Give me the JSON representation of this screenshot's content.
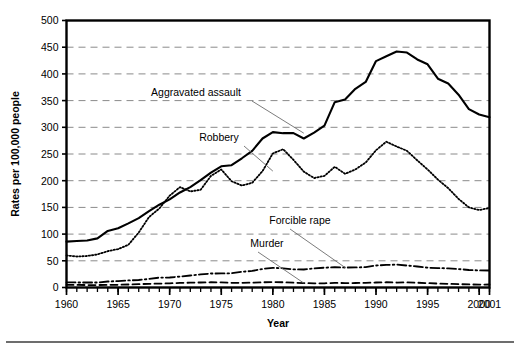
{
  "chart_data": {
    "type": "line",
    "title": "",
    "xlabel": "Year",
    "ylabel": "Rates per 100,000 people",
    "xlim": [
      1960,
      2001
    ],
    "ylim": [
      0,
      500
    ],
    "ytick_step": 50,
    "yticks": [
      0,
      50,
      100,
      150,
      200,
      250,
      300,
      350,
      400,
      450,
      500
    ],
    "xticks": [
      1960,
      1965,
      1970,
      1975,
      1980,
      1985,
      1990,
      1995,
      2000,
      2001
    ],
    "xtick_labels": [
      "1960",
      "1965",
      "1970",
      "1975",
      "1980",
      "1985",
      "1990",
      "1995",
      "2000",
      "2001"
    ],
    "ytick_labels": [
      "0",
      "50",
      "100",
      "150",
      "200",
      "250",
      "300",
      "350",
      "400",
      "450",
      "500"
    ],
    "minor_xticks_every": 1,
    "grid": "horizontal-dashed",
    "legend": "none-inline-annotations",
    "x": [
      1960,
      1961,
      1962,
      1963,
      1964,
      1965,
      1966,
      1967,
      1968,
      1969,
      1970,
      1971,
      1972,
      1973,
      1974,
      1975,
      1976,
      1977,
      1978,
      1979,
      1980,
      1981,
      1982,
      1983,
      1984,
      1985,
      1986,
      1987,
      1988,
      1989,
      1990,
      1991,
      1992,
      1993,
      1994,
      1995,
      1996,
      1997,
      1998,
      1999,
      2000,
      2001
    ],
    "series": [
      {
        "name": "Aggravated assault",
        "style": "solid",
        "color": "#000000",
        "values": [
          86,
          87,
          88,
          92,
          106,
          111,
          120,
          130,
          143,
          155,
          165,
          178,
          188,
          201,
          215,
          227,
          229,
          242,
          256,
          279,
          291,
          289,
          289,
          279,
          290,
          303,
          347,
          352,
          372,
          385,
          424,
          433,
          442,
          440,
          427,
          418,
          391,
          382,
          361,
          334,
          324,
          319
        ]
      },
      {
        "name": "Robbery",
        "style": "dotted",
        "color": "#000000",
        "values": [
          60,
          58,
          59,
          62,
          68,
          72,
          80,
          103,
          132,
          148,
          172,
          188,
          180,
          183,
          209,
          221,
          199,
          191,
          196,
          218,
          251,
          259,
          239,
          217,
          205,
          209,
          226,
          213,
          221,
          234,
          257,
          273,
          264,
          256,
          238,
          221,
          202,
          186,
          166,
          150,
          145,
          149
        ]
      },
      {
        "name": "Forcible rape",
        "style": "dashdot",
        "color": "#000000",
        "values": [
          9.6,
          9.4,
          9.4,
          9.4,
          11.2,
          12.1,
          13.2,
          14.0,
          15.9,
          18.5,
          18.7,
          20.5,
          22.5,
          24.5,
          26.2,
          26.3,
          26.6,
          29.4,
          31.0,
          34.7,
          36.8,
          36.0,
          34.0,
          33.7,
          35.7,
          37.1,
          38.1,
          37.4,
          37.6,
          38.1,
          41.2,
          42.3,
          42.8,
          41.1,
          39.3,
          37.1,
          36.3,
          35.9,
          34.5,
          32.8,
          32.0,
          31.8
        ]
      },
      {
        "name": "Murder",
        "style": "dashed",
        "color": "#000000",
        "values": [
          5.1,
          4.8,
          4.6,
          4.6,
          4.9,
          5.1,
          5.6,
          6.2,
          6.9,
          7.3,
          7.9,
          8.6,
          9.0,
          9.4,
          9.8,
          9.6,
          8.8,
          8.8,
          9.0,
          9.7,
          10.2,
          9.8,
          9.1,
          8.3,
          7.9,
          7.9,
          8.6,
          8.3,
          8.4,
          8.7,
          9.4,
          9.8,
          9.3,
          9.5,
          9.0,
          8.2,
          7.4,
          6.8,
          6.3,
          5.7,
          5.5,
          5.6
        ]
      }
    ],
    "annotations": [
      {
        "label": "Aggravated assault",
        "target_year": 1983,
        "target_value": 289
      },
      {
        "label": "Robbery",
        "target_year": 1980,
        "target_value": 218
      },
      {
        "label": "Forcible rape",
        "target_year": 1987,
        "target_value": 37.4
      },
      {
        "label": "Murder",
        "target_year": 1983,
        "target_value": 8.3
      }
    ]
  },
  "style": {
    "axis_color": "#000000",
    "grid_color": "#8a8a8a",
    "text_color": "#000000",
    "leader_color": "#6d6d6d",
    "footer_rule_color": "#6d6d6d",
    "background": "#ffffff"
  }
}
